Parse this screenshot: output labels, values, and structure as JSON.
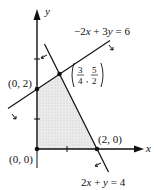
{
  "diagram": {
    "type": "feasible-region",
    "axes": {
      "x_label": "x",
      "y_label": "y",
      "origin_px": [
        37,
        149
      ],
      "scale_px_per_unit": 30,
      "x_ticks": [
        1,
        2
      ],
      "y_ticks": [
        1,
        2,
        3
      ]
    },
    "lines": [
      {
        "id": "line1",
        "equation": "−2x + 3y = 6",
        "label_parts": [
          "−2",
          "x",
          " + 3",
          "y",
          " = 6"
        ]
      },
      {
        "id": "line2",
        "equation": "2x + y = 4",
        "label_parts": [
          "2",
          "x",
          " + ",
          "y",
          " = 4"
        ]
      }
    ],
    "vertices": [
      {
        "label": "(0, 0)",
        "x": 0,
        "y": 0
      },
      {
        "label": "(0, 2)",
        "x": 0,
        "y": 2
      },
      {
        "label_num_x": "3",
        "label_den_x": "4",
        "label_num_y": "5",
        "label_den_y": "2",
        "x": 0.75,
        "y": 2.5
      },
      {
        "label": "(2, 0)",
        "x": 2,
        "y": 0
      }
    ],
    "region_fill": "#e4e4e4",
    "ink": "#111111"
  }
}
